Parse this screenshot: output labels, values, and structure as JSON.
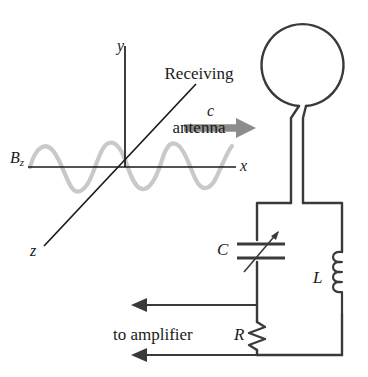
{
  "figure": {
    "background_color": "#ffffff",
    "stroke_color": "#3a3a3a",
    "axis_color": "#1a1a1a",
    "wave_color": "#c9c9c9",
    "arrow_c_color": "#8c8c8c",
    "text_color": "#1a1a1a"
  },
  "axes": {
    "x_label": "x",
    "y_label": "y",
    "z_label": "z",
    "origin": {
      "x": 125,
      "y": 167
    }
  },
  "field": {
    "label_base": "B",
    "label_subscript": "z",
    "wave_cycles": 3,
    "wave_amplitude": 22,
    "wave_start_x": 30,
    "wave_end_x": 232
  },
  "propagation": {
    "label": "c",
    "direction": "right",
    "arrow_start_x": 184,
    "arrow_end_x": 252,
    "arrow_y": 128
  },
  "antenna": {
    "caption_line1": "Receiving",
    "caption_line2": "antenna",
    "loop_center_x": 311,
    "loop_center_y": 67,
    "loop_radius": 41
  },
  "circuit": {
    "capacitor_label": "C",
    "capacitor_type": "variable",
    "inductor_label": "L",
    "inductor_turns": 4,
    "resistor_label": "R",
    "output_label": "to amplifier",
    "output_arrow_count": 2,
    "output_direction": "left"
  }
}
